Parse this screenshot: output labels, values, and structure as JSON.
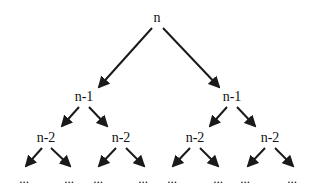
{
  "diagram": {
    "type": "recursion-tree",
    "colors": {
      "stroke": "#1a1a1a",
      "text": "#111111",
      "background": "#ffffff"
    },
    "nodes": [
      {
        "id": "root",
        "label": "n",
        "x": 157,
        "y": 22
      },
      {
        "id": "l",
        "label": "n-1",
        "x": 84,
        "y": 101
      },
      {
        "id": "r",
        "label": "n-1",
        "x": 232,
        "y": 101
      },
      {
        "id": "ll",
        "label": "n-2",
        "x": 46,
        "y": 142
      },
      {
        "id": "lr",
        "label": "n-2",
        "x": 121,
        "y": 142
      },
      {
        "id": "rl",
        "label": "n-2",
        "x": 195,
        "y": 142
      },
      {
        "id": "rr",
        "label": "n-2",
        "x": 270,
        "y": 142
      },
      {
        "id": "lll",
        "label": "...",
        "x": 24,
        "y": 183
      },
      {
        "id": "llr",
        "label": "...",
        "x": 69,
        "y": 183
      },
      {
        "id": "lrl",
        "label": "...",
        "x": 98,
        "y": 183
      },
      {
        "id": "lrr",
        "label": "...",
        "x": 143,
        "y": 183
      },
      {
        "id": "rll",
        "label": "...",
        "x": 172,
        "y": 183
      },
      {
        "id": "rlr",
        "label": "...",
        "x": 218,
        "y": 183
      },
      {
        "id": "rrl",
        "label": "...",
        "x": 245,
        "y": 183
      },
      {
        "id": "rrr",
        "label": "...",
        "x": 292,
        "y": 183
      }
    ],
    "edges": [
      {
        "from": "root",
        "to": "l",
        "x1": 152,
        "y1": 28,
        "x2": 99,
        "y2": 87
      },
      {
        "from": "root",
        "to": "r",
        "x1": 163,
        "y1": 28,
        "x2": 219,
        "y2": 87
      },
      {
        "from": "l",
        "to": "ll",
        "x1": 79,
        "y1": 107,
        "x2": 62,
        "y2": 126
      },
      {
        "from": "l",
        "to": "lr",
        "x1": 89,
        "y1": 107,
        "x2": 107,
        "y2": 126
      },
      {
        "from": "r",
        "to": "rl",
        "x1": 227,
        "y1": 107,
        "x2": 210,
        "y2": 126
      },
      {
        "from": "r",
        "to": "rr",
        "x1": 237,
        "y1": 107,
        "x2": 255,
        "y2": 126
      },
      {
        "from": "ll",
        "to": "lll",
        "x1": 42,
        "y1": 148,
        "x2": 26,
        "y2": 166
      },
      {
        "from": "ll",
        "to": "llr",
        "x1": 51,
        "y1": 148,
        "x2": 70,
        "y2": 166
      },
      {
        "from": "lr",
        "to": "lrl",
        "x1": 116,
        "y1": 148,
        "x2": 99,
        "y2": 166
      },
      {
        "from": "lr",
        "to": "lrr",
        "x1": 126,
        "y1": 148,
        "x2": 144,
        "y2": 166
      },
      {
        "from": "rl",
        "to": "rll",
        "x1": 190,
        "y1": 148,
        "x2": 173,
        "y2": 166
      },
      {
        "from": "rl",
        "to": "rlr",
        "x1": 200,
        "y1": 148,
        "x2": 218,
        "y2": 166
      },
      {
        "from": "rr",
        "to": "rrl",
        "x1": 265,
        "y1": 148,
        "x2": 248,
        "y2": 166
      },
      {
        "from": "rr",
        "to": "rrr",
        "x1": 275,
        "y1": 148,
        "x2": 293,
        "y2": 166
      }
    ]
  }
}
